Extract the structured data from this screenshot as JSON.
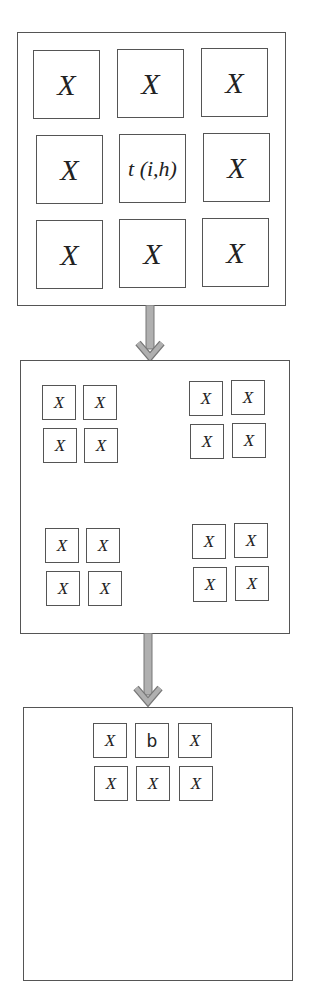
{
  "diagram": {
    "panel1": {
      "label": "original-grid",
      "cells": [
        "X",
        "X",
        "X",
        "X",
        "t (i,h)",
        "X",
        "X",
        "X",
        "X"
      ]
    },
    "panel2": {
      "label": "split-groups",
      "groups": [
        {
          "cells": [
            "X",
            "X",
            "X",
            "X"
          ]
        },
        {
          "cells": [
            "X",
            "X",
            "X",
            "X"
          ]
        },
        {
          "cells": [
            "X",
            "X",
            "X",
            "X"
          ]
        },
        {
          "cells": [
            "X",
            "X",
            "X",
            "X"
          ]
        }
      ]
    },
    "panel3": {
      "label": "result-grid",
      "cells": [
        "X",
        "b",
        "X",
        "X",
        "X",
        "X"
      ]
    },
    "arrow_color": "#b0b0b0",
    "border_color": "#555555"
  }
}
